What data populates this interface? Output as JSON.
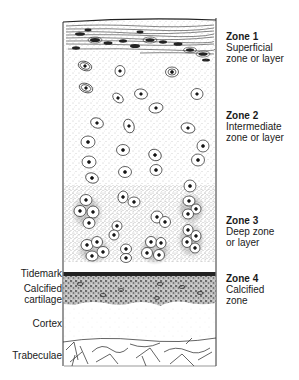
{
  "figure": {
    "zones": [
      {
        "title": "Zone 1",
        "desc_line1": "Superficial",
        "desc_line2": "zone or layer"
      },
      {
        "title": "Zone 2",
        "desc_line1": "Intermediate",
        "desc_line2": "zone or layer"
      },
      {
        "title": "Zone 3",
        "desc_line1": "Deep zone",
        "desc_line2": "or layer"
      },
      {
        "title": "Zone 4",
        "desc_line1": "Calcified",
        "desc_line2": "zone"
      }
    ],
    "tissues": [
      {
        "label": "Tidemark"
      },
      {
        "label_line1": "Calcified",
        "label_line2": "cartilage"
      },
      {
        "label": "Cortex"
      },
      {
        "label": "Trabeculae"
      }
    ],
    "colors": {
      "ink": "#1a1a1a",
      "stipple": "#9a9a9a",
      "background": "#ffffff",
      "tidemark": "#222222"
    }
  }
}
